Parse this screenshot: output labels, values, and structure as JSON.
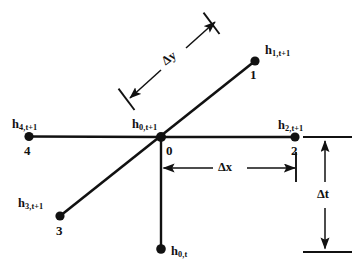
{
  "figure": {
    "type": "finite-difference-stencil-diagram",
    "background_color": "#ffffff",
    "ink_color": "#111111"
  },
  "nodes": [
    {
      "id": "node-1",
      "number": "1",
      "head_base": "h",
      "head_subscript": "1,t+1",
      "x": 255,
      "y": 61
    },
    {
      "id": "node-2",
      "number": "2",
      "head_base": "h",
      "head_subscript": "2,t+1",
      "x": 295,
      "y": 137
    },
    {
      "id": "node-3",
      "number": "3",
      "head_base": "h",
      "head_subscript": "3,t+1",
      "x": 60,
      "y": 216
    },
    {
      "id": "node-4",
      "number": "4",
      "head_base": "h",
      "head_subscript": "4,t+1",
      "x": 29,
      "y": 136
    },
    {
      "id": "node-0",
      "number": "0",
      "head_base": "h",
      "head_subscript": "0,t+1",
      "x": 161,
      "y": 137
    },
    {
      "id": "node-0-old-time",
      "number": "",
      "head_base": "h",
      "head_subscript": "0,t",
      "x": 161,
      "y": 249
    }
  ],
  "dimensions": [
    {
      "id": "delta-y",
      "symbol": "Δy",
      "orientation": "diagonal",
      "from_x": 130,
      "from_y": 98,
      "to_x": 215,
      "to_y": 22
    },
    {
      "id": "delta-x",
      "symbol": "Δx",
      "orientation": "horizontal",
      "from_x": 163,
      "from_y": 168,
      "to_x": 296,
      "to_y": 168
    },
    {
      "id": "delta-t",
      "symbol": "Δt",
      "orientation": "vertical",
      "from_x": 325,
      "from_y": 143,
      "to_x": 325,
      "to_y": 247
    }
  ]
}
